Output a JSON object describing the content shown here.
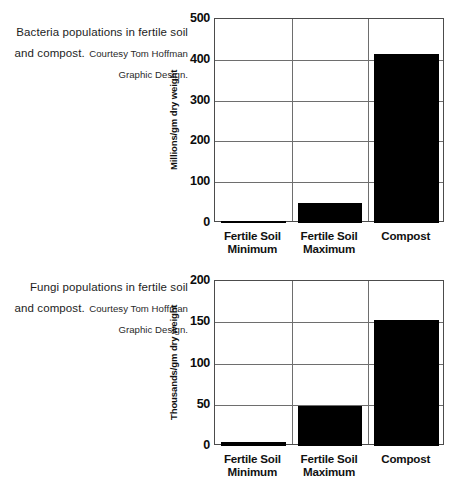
{
  "figures": [
    {
      "id": "bacteria",
      "caption_main": "Bacteria populations in fertile soil and compost.",
      "caption_credit": "Courtesy Tom Hoffman Graphic Design.",
      "chart_data": {
        "type": "bar",
        "title": "Bacteria populations in fertile soil and compost.",
        "xlabel": "",
        "ylabel": "Millions/gm dry weight",
        "categories": [
          "Fertile Soil Minimum",
          "Fertile Soil Maximum",
          "Compost"
        ],
        "category_lines": [
          [
            "Fertile Soil",
            "Minimum"
          ],
          [
            "Fertile Soil",
            "Maximum"
          ],
          [
            "Compost",
            ""
          ]
        ],
        "values": [
          5,
          50,
          413
        ],
        "ylim": [
          0,
          500
        ],
        "ytick_step": 100,
        "yticks": [
          0,
          100,
          200,
          300,
          400,
          500
        ],
        "grid": true,
        "legend": "none",
        "bar_color": "#000000"
      }
    },
    {
      "id": "fungi",
      "caption_main": "Fungi populations in fertile soil and compost.",
      "caption_credit": "Courtesy Tom Hoffman Graphic Design.",
      "chart_data": {
        "type": "bar",
        "title": "Fungi populations in fertile soil and compost.",
        "xlabel": "",
        "ylabel": "Thousands/gm dry weight",
        "categories": [
          "Fertile Soil Minimum",
          "Fertile Soil Maximum",
          "Compost"
        ],
        "category_lines": [
          [
            "Fertile Soil",
            "Minimum"
          ],
          [
            "Fertile Soil",
            "Maximum"
          ],
          [
            "Compost",
            ""
          ]
        ],
        "values": [
          5,
          48,
          153
        ],
        "ylim": [
          0,
          200
        ],
        "ytick_step": 50,
        "yticks": [
          0,
          50,
          100,
          150,
          200
        ],
        "grid": true,
        "legend": "none",
        "bar_color": "#000000"
      }
    }
  ],
  "layout": {
    "plot_width": 230,
    "plot_height_bacteria": 204,
    "plot_height_fungi": 165,
    "bar_inset": 6,
    "axis_color": "#4c4c4c",
    "grid_color": "#6e6e6e",
    "background": "#ffffff"
  }
}
